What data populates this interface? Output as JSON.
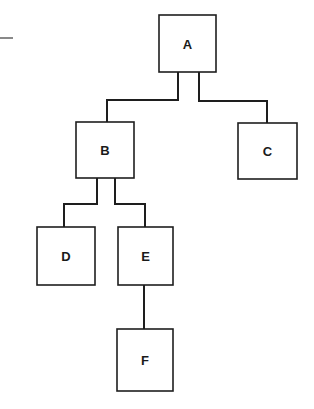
{
  "diagram": {
    "type": "tree",
    "title": "",
    "colors": {
      "background": "#ffffff",
      "stroke": "#1e1e1e",
      "text": "#1a1a1a"
    },
    "nodes": [
      {
        "id": "A",
        "label": "A",
        "x": 159,
        "y": 15,
        "w": 57,
        "h": 57
      },
      {
        "id": "B",
        "label": "B",
        "x": 76,
        "y": 122,
        "w": 58,
        "h": 56
      },
      {
        "id": "C",
        "label": "C",
        "x": 238,
        "y": 123,
        "w": 59,
        "h": 56
      },
      {
        "id": "D",
        "label": "D",
        "x": 37,
        "y": 227,
        "w": 58,
        "h": 58
      },
      {
        "id": "E",
        "label": "E",
        "x": 118,
        "y": 227,
        "w": 55,
        "h": 58
      },
      {
        "id": "F",
        "label": "F",
        "x": 117,
        "y": 329,
        "w": 56,
        "h": 62
      }
    ],
    "edges": [
      {
        "from": "A",
        "to": "B"
      },
      {
        "from": "A",
        "to": "C"
      },
      {
        "from": "B",
        "to": "D"
      },
      {
        "from": "B",
        "to": "E"
      },
      {
        "from": "E",
        "to": "F"
      }
    ]
  }
}
